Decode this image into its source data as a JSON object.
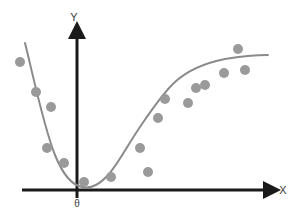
{
  "chart_data": {
    "type": "scatter",
    "title": "",
    "subtitle": "",
    "xlabel": "X",
    "ylabel": "Y",
    "origin_label": "θ",
    "grid": false,
    "legend": null,
    "xlim": [
      -1.05,
      4.2
    ],
    "ylim": [
      -0.15,
      2.45
    ],
    "axis_arrows": true,
    "x": [
      -0.95,
      -0.8,
      -0.72,
      -0.6,
      -0.5,
      -0.3,
      -0.05,
      0.4,
      0.75,
      1.0,
      1.25,
      1.45,
      1.6,
      1.85,
      2.05,
      2.25,
      2.45,
      2.7,
      2.95,
      3.3,
      3.55
    ],
    "y": [
      1.82,
      1.3,
      1.04,
      0.78,
      0.6,
      0.33,
      0.21,
      0.24,
      0.19,
      0.52,
      0.3,
      0.77,
      0.95,
      1.15,
      1.28,
      1.46,
      1.44,
      1.61,
      1.98,
      1.72,
      1.6
    ],
    "points": [
      {
        "cx": 20.0,
        "cy": 62.0
      },
      {
        "cx": 36.0,
        "cy": 92.0
      },
      {
        "cx": 51.0,
        "cy": 107.0
      },
      {
        "cx": 47.0,
        "cy": 148.0
      },
      {
        "cx": 64.0,
        "cy": 163.0
      },
      {
        "cx": 84.0,
        "cy": 182.0
      },
      {
        "cx": 111.0,
        "cy": 177.0
      },
      {
        "cx": 148.0,
        "cy": 172.0
      },
      {
        "cx": 140.0,
        "cy": 148.0
      },
      {
        "cx": 158.0,
        "cy": 118.0
      },
      {
        "cx": 165.0,
        "cy": 99.0
      },
      {
        "cx": 188.0,
        "cy": 103.0
      },
      {
        "cx": 196.0,
        "cy": 88.0
      },
      {
        "cx": 205.0,
        "cy": 85.0
      },
      {
        "cx": 224.0,
        "cy": 73.0
      },
      {
        "cx": 238.0,
        "cy": 49.0
      },
      {
        "cx": 245.0,
        "cy": 70.0
      }
    ],
    "curve_path": "M 25,43 C 33,75 44,128 55,155 C 63,175 72,185 82,187 C 92,189 100,184 109,174 C 120,161 130,141 142,124 C 153,108 163,93 175,82 C 188,70 205,63 225,59 C 243,56 257,55 268,55",
    "series_style": {
      "point_color": "#9a9a9a",
      "point_radius": 5,
      "curve_color": "#8a8a8a",
      "curve_width": 2,
      "axis_color": "#1a1a1a",
      "axis_width": 3,
      "background": "#ffffff"
    },
    "axes_geometry": {
      "origin_x": 77,
      "origin_y": 190,
      "x_axis_start": 22,
      "x_axis_end": 272,
      "y_axis_top": 30
    },
    "annotations": []
  }
}
